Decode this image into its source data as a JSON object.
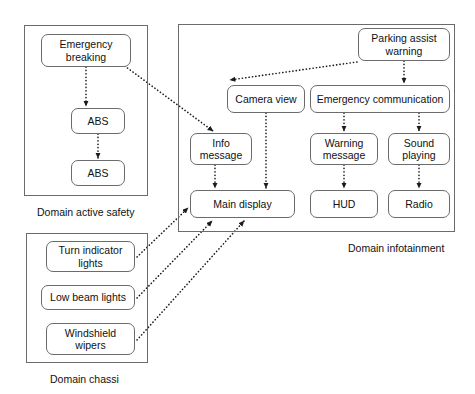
{
  "diagram": {
    "background_color": "#ffffff",
    "line_color": "#1b1b1b",
    "box_border_color": "#6b6b6b"
  },
  "domains": [
    {
      "id": "active-safety",
      "label": "Domain active safety",
      "x": 24,
      "y": 25,
      "w": 124,
      "h": 171,
      "label_x": 37,
      "label_y": 206
    },
    {
      "id": "chassi",
      "label": "Domain chassi",
      "x": 26,
      "y": 233,
      "w": 122,
      "h": 130,
      "label_x": 50,
      "label_y": 373
    },
    {
      "id": "infotainment",
      "label": "Domain infotainment",
      "x": 178,
      "y": 24,
      "w": 277,
      "h": 208,
      "label_x": 348,
      "label_y": 242
    }
  ],
  "nodes": [
    {
      "id": "emergency-breaking",
      "label": "Emergency\nbreaking",
      "domain": "active-safety",
      "x": 41,
      "y": 34,
      "w": 90,
      "h": 33
    },
    {
      "id": "abs-1",
      "label": "ABS",
      "domain": "active-safety",
      "x": 71,
      "y": 108,
      "w": 54,
      "h": 26
    },
    {
      "id": "abs-2",
      "label": "ABS",
      "domain": "active-safety",
      "x": 71,
      "y": 160,
      "w": 54,
      "h": 26
    },
    {
      "id": "turn-indicator-lights",
      "label": "Turn indicator\nlights",
      "domain": "chassi",
      "x": 46,
      "y": 241,
      "w": 89,
      "h": 31
    },
    {
      "id": "low-beam-lights",
      "label": "Low beam lights",
      "domain": "chassi",
      "x": 41,
      "y": 285,
      "w": 94,
      "h": 25
    },
    {
      "id": "windshield-wipers",
      "label": "Windshield\nwipers",
      "domain": "chassi",
      "x": 46,
      "y": 323,
      "w": 89,
      "h": 32
    },
    {
      "id": "parking-assist-warning",
      "label": "Parking assist\nwarning",
      "domain": "infotainment",
      "x": 358,
      "y": 28,
      "w": 92,
      "h": 33
    },
    {
      "id": "camera-view",
      "label": "Camera view",
      "domain": "infotainment",
      "x": 227,
      "y": 85,
      "w": 78,
      "h": 28
    },
    {
      "id": "emergency-communication",
      "label": "Emergency communication",
      "domain": "infotainment",
      "x": 310,
      "y": 85,
      "w": 140,
      "h": 28
    },
    {
      "id": "info-message",
      "label": "Info\nmessage",
      "domain": "infotainment",
      "x": 190,
      "y": 133,
      "w": 62,
      "h": 32
    },
    {
      "id": "warning-message",
      "label": "Warning\nmessage",
      "domain": "infotainment",
      "x": 310,
      "y": 133,
      "w": 68,
      "h": 32
    },
    {
      "id": "sound-playing",
      "label": "Sound\nplaying",
      "domain": "infotainment",
      "x": 388,
      "y": 133,
      "w": 62,
      "h": 32
    },
    {
      "id": "main-display",
      "label": "Main display",
      "domain": "infotainment",
      "x": 190,
      "y": 190,
      "w": 105,
      "h": 28
    },
    {
      "id": "hud",
      "label": "HUD",
      "domain": "infotainment",
      "x": 310,
      "y": 190,
      "w": 68,
      "h": 28
    },
    {
      "id": "radio",
      "label": "Radio",
      "domain": "infotainment",
      "x": 388,
      "y": 190,
      "w": 62,
      "h": 28
    }
  ],
  "edges": [
    {
      "id": "edge-emergency-breaking-to-abs1",
      "from": "emergency-breaking",
      "to": "abs-1",
      "x1": 86,
      "y1": 67,
      "x2": 86,
      "y2": 106,
      "style": "dotted-arrow"
    },
    {
      "id": "edge-abs1-to-abs2",
      "from": "abs-1",
      "to": "abs-2",
      "x1": 98,
      "y1": 134,
      "x2": 98,
      "y2": 158,
      "style": "dotted-arrow"
    },
    {
      "id": "edge-emergency-breaking-to-info",
      "from": "emergency-breaking",
      "to": "info-message",
      "x1": 122,
      "y1": 64,
      "x2": 213,
      "y2": 131,
      "style": "dotted-arrow"
    },
    {
      "id": "edge-parking-assist-to-camera-view",
      "from": "parking-assist-warning",
      "to": "camera-view",
      "x1": 357,
      "y1": 62,
      "x2": 230,
      "y2": 80,
      "style": "dotted-arrow"
    },
    {
      "id": "edge-parking-assist-to-emergency-comm",
      "from": "parking-assist-warning",
      "to": "emergency-communication",
      "x1": 404,
      "y1": 61,
      "x2": 404,
      "y2": 83,
      "style": "dotted-arrow"
    },
    {
      "id": "edge-camera-view-to-main-display",
      "from": "camera-view",
      "to": "main-display",
      "x1": 266,
      "y1": 113,
      "x2": 266,
      "y2": 188,
      "style": "dotted-arrow"
    },
    {
      "id": "edge-info-message-to-main-display",
      "from": "info-message",
      "to": "main-display",
      "x1": 215,
      "y1": 165,
      "x2": 215,
      "y2": 188,
      "style": "dotted-arrow"
    },
    {
      "id": "edge-emergency-comm-to-warning",
      "from": "emergency-communication",
      "to": "warning-message",
      "x1": 344,
      "y1": 113,
      "x2": 344,
      "y2": 131,
      "style": "dotted-arrow"
    },
    {
      "id": "edge-emergency-comm-to-sound",
      "from": "emergency-communication",
      "to": "sound-playing",
      "x1": 419,
      "y1": 113,
      "x2": 419,
      "y2": 131,
      "style": "dotted-arrow"
    },
    {
      "id": "edge-warning-message-to-hud",
      "from": "warning-message",
      "to": "hud",
      "x1": 344,
      "y1": 165,
      "x2": 344,
      "y2": 188,
      "style": "dotted-arrow"
    },
    {
      "id": "edge-sound-playing-to-radio",
      "from": "sound-playing",
      "to": "radio",
      "x1": 419,
      "y1": 165,
      "x2": 419,
      "y2": 188,
      "style": "dotted-arrow"
    },
    {
      "id": "edge-turn-indicator-to-main-display",
      "from": "turn-indicator-lights",
      "to": "main-display",
      "x1": 137,
      "y1": 257,
      "x2": 188,
      "y2": 208,
      "style": "dotted-arrow"
    },
    {
      "id": "edge-low-beam-to-main-display",
      "from": "low-beam-lights",
      "to": "main-display",
      "x1": 137,
      "y1": 298,
      "x2": 212,
      "y2": 221,
      "style": "dotted-arrow"
    },
    {
      "id": "edge-windshield-wipers-to-main-display",
      "from": "windshield-wipers",
      "to": "main-display",
      "x1": 137,
      "y1": 340,
      "x2": 244,
      "y2": 221,
      "style": "dotted-arrow"
    }
  ]
}
